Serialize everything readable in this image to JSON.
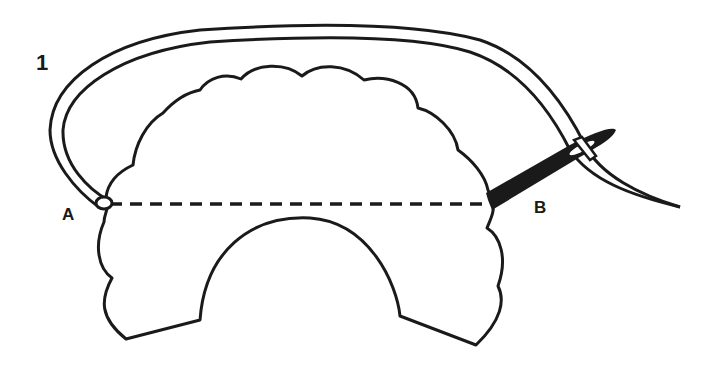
{
  "diagram": {
    "step_number": "1",
    "point_a_label": "A",
    "point_b_label": "B",
    "elements": [
      {
        "name": "fabric-piece",
        "description": "scalloped semicircular fabric shape with arch cutout at bottom"
      },
      {
        "name": "stitch-line",
        "description": "dashed line from A to B"
      },
      {
        "name": "thread",
        "description": "double-outlined thread looping over the top from A to needle eye"
      },
      {
        "name": "needle",
        "description": "black needle inserted at B with thread through eye"
      }
    ],
    "colors": {
      "stroke": "#1a1a1a",
      "fill": "#ffffff",
      "needle": "#1a1a1a"
    }
  }
}
